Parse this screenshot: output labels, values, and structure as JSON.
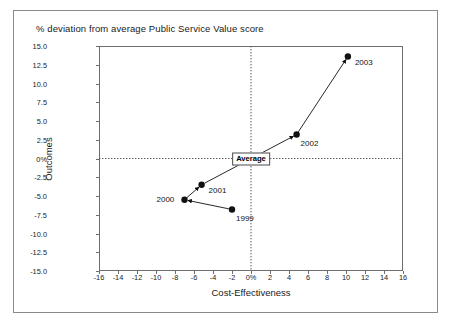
{
  "figure": {
    "title": "% deviation from average Public Service Value score",
    "average_badge": "Average"
  },
  "chart_data": {
    "type": "scatter",
    "title": "% deviation from average Public Service Value score",
    "xlabel": "Cost-Effectiveness",
    "ylabel": "Outcomes",
    "xlim": [
      -16,
      16
    ],
    "ylim": [
      -15.0,
      15.0
    ],
    "xticks": [
      "-16",
      "-14",
      "-12",
      "-10",
      "-8",
      "-6",
      "-4",
      "-2",
      "0%",
      "2",
      "4",
      "6",
      "8",
      "10",
      "12",
      "14",
      "16"
    ],
    "xtick_values": [
      -16,
      -14,
      -12,
      -10,
      -8,
      -6,
      -4,
      -2,
      0,
      2,
      4,
      6,
      8,
      10,
      12,
      14,
      16
    ],
    "yticks": [
      "15.0",
      "12.5",
      "10.0",
      "7.5",
      "5.0",
      "2.5",
      "0%",
      "-2.5",
      "-5.0",
      "-7.5",
      "-10.0",
      "-12.5",
      "-15.0"
    ],
    "ytick_values": [
      15.0,
      12.5,
      10.0,
      7.5,
      5.0,
      2.5,
      0,
      -2.5,
      -5.0,
      -7.5,
      -10.0,
      -12.5,
      -15.0
    ],
    "grid": false,
    "zero_lines": true,
    "legend": "none",
    "annotations": [
      "Average"
    ],
    "connected": true,
    "series": [
      {
        "name": "Public Service Value trajectory",
        "points": [
          {
            "label": "1999",
            "x": -2.0,
            "y": -6.8,
            "label_pos": "below-right"
          },
          {
            "label": "2000",
            "x": -7.0,
            "y": -5.5,
            "label_pos": "left"
          },
          {
            "label": "2001",
            "x": -5.2,
            "y": -3.5,
            "label_pos": "right"
          },
          {
            "label": "2002",
            "x": 4.8,
            "y": 3.2,
            "label_pos": "below-right"
          },
          {
            "label": "2003",
            "x": 10.2,
            "y": 13.6,
            "label_pos": "right"
          }
        ]
      }
    ]
  }
}
